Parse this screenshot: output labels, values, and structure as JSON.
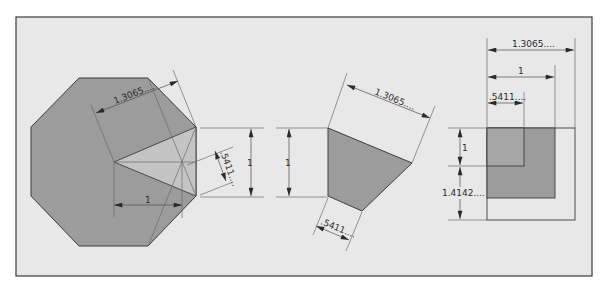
{
  "colors": {
    "page_bg": "#ffffff",
    "panel_bg": "#e8e8e8",
    "frame": "#3a3a3a",
    "shape_fill": "#9c9c9c",
    "highlight_fill": "#c4c4c4",
    "inner_square_fill": "#a6a6a6",
    "line": "#444444"
  },
  "figures": {
    "octagon": {
      "labels": {
        "radius_dim": "1.3065....",
        "base_dim": "1",
        "offset_dim": ".5411...."
      }
    },
    "height_dims": {
      "first": "1",
      "second": "1"
    },
    "trapezoid": {
      "labels": {
        "top_dim": "1.3065....",
        "bottom_dim": ".5411...."
      }
    },
    "square": {
      "labels": {
        "outer_width_dim": "1.3065....",
        "mid_width_dim": "1",
        "inner_width_dim": ".5411....",
        "top_height_dim": "1",
        "bottom_height_dim": "1.4142...."
      }
    }
  }
}
